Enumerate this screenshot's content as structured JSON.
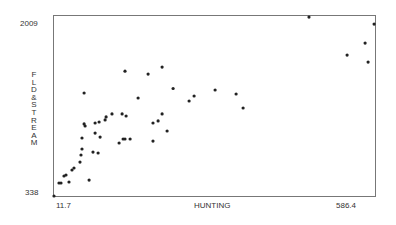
{
  "chart_data": {
    "type": "scatter",
    "title": "",
    "xlabel": "HUNTING",
    "ylabel": "FLD&STREAM",
    "xlim": [
      11.7,
      586.4
    ],
    "ylim": [
      338,
      2009
    ],
    "x_ticks": [
      "11.7",
      "586.4"
    ],
    "y_ticks": [
      "338",
      "2009"
    ],
    "grid": false,
    "legend": null,
    "points": [
      [
        11.7,
        338
      ],
      [
        20.6,
        459
      ],
      [
        24.2,
        459
      ],
      [
        29.6,
        524
      ],
      [
        33.2,
        533
      ],
      [
        38.6,
        468
      ],
      [
        44.0,
        579
      ],
      [
        47.5,
        598
      ],
      [
        58.3,
        653
      ],
      [
        60.1,
        719
      ],
      [
        61.9,
        774
      ],
      [
        61.9,
        876
      ],
      [
        65.5,
        1294
      ],
      [
        65.5,
        1007
      ],
      [
        67.3,
        988
      ],
      [
        74.5,
        486
      ],
      [
        81.6,
        746
      ],
      [
        85.2,
        922
      ],
      [
        85.2,
        1016
      ],
      [
        90.6,
        737
      ],
      [
        92.4,
        1025
      ],
      [
        94.2,
        885
      ],
      [
        104.9,
        1072
      ],
      [
        103.1,
        1044
      ],
      [
        115.6,
        1100
      ],
      [
        128.2,
        830
      ],
      [
        133.6,
        1100
      ],
      [
        135.4,
        867
      ],
      [
        138.9,
        867
      ],
      [
        140.7,
        1081
      ],
      [
        138.9,
        1497
      ],
      [
        147.9,
        867
      ],
      [
        162.2,
        1248
      ],
      [
        180.1,
        1470
      ],
      [
        189.0,
        1016
      ],
      [
        189.0,
        848
      ],
      [
        198.0,
        1035
      ],
      [
        205.2,
        1535
      ],
      [
        205.2,
        1100
      ],
      [
        214.1,
        941
      ],
      [
        224.9,
        1336
      ],
      [
        253.5,
        1220
      ],
      [
        262.5,
        1266
      ],
      [
        300.1,
        1322
      ],
      [
        337.7,
        1285
      ],
      [
        350.2,
        1155
      ],
      [
        468.3,
        1999
      ],
      [
        536.4,
        1646
      ],
      [
        568.6,
        1757
      ],
      [
        574.0,
        1581
      ],
      [
        584.7,
        1934
      ]
    ]
  },
  "axes": {
    "y_max_label": "2009",
    "y_min_label": "338",
    "x_min_label": "11.7",
    "x_max_label": "586.4",
    "x_title": "HUNTING",
    "y_title": "FLD&STREAM"
  },
  "style": {
    "point_color": "#222222",
    "axis_color": "#777777"
  }
}
